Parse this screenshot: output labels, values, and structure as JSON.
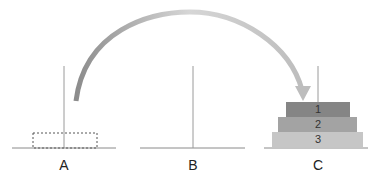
{
  "diagram": {
    "pegs": [
      {
        "label": "A",
        "x": 64
      },
      {
        "label": "B",
        "x": 193
      },
      {
        "label": "C",
        "x": 318
      }
    ],
    "disks": [
      {
        "label": "1",
        "color": "#858585"
      },
      {
        "label": "2",
        "color": "#a3a3a3"
      },
      {
        "label": "3",
        "color": "#c6c6c6"
      }
    ],
    "placeholder_on": "A",
    "arrow": {
      "from": "A",
      "to": "C"
    }
  }
}
